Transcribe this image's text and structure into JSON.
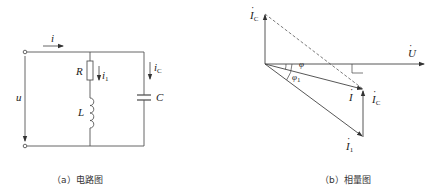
{
  "circuit": {
    "caption": "（a）电路图",
    "labels": {
      "current_total": "i",
      "current_branch1": "i",
      "current_branch1_sub": "1",
      "current_capacitor": "i",
      "current_capacitor_sub": "C",
      "resistor": "R",
      "inductor": "L",
      "capacitor": "C",
      "voltage": "u"
    },
    "stroke_color": "#555555"
  },
  "phasor": {
    "caption": "（b）相量图",
    "labels": {
      "voltage_phasor": "U",
      "total_current_phasor": "I",
      "branch1_current_phasor": "I",
      "branch1_current_sub": "1",
      "capacitor_current_top": "I",
      "capacitor_current_top_sub": "C",
      "capacitor_current_side": "I",
      "capacitor_current_side_sub": "C",
      "angle_phi": "φ",
      "angle_phi1": "φ",
      "angle_phi1_sub": "1"
    },
    "stroke_color": "#444444"
  }
}
